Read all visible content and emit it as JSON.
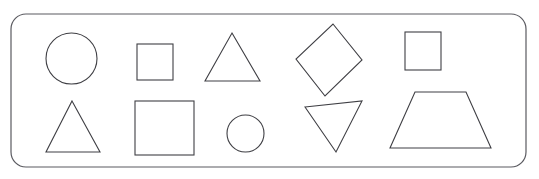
{
  "canvas": {
    "width": 539,
    "height": 179,
    "background_color": "#ffffff",
    "stroke_color": "#3f3f44",
    "fill_color": "none",
    "stroke_width": 1.1,
    "title": "Geometric Shapes Worksheet Panel"
  },
  "frame": {
    "name": "rounded-rectangle-frame",
    "x": 11,
    "y": 14,
    "width": 515,
    "height": 153,
    "corner_radius": 15,
    "stroke_color": "#5a5a60",
    "stroke_width": 1.2
  },
  "rows": [
    {
      "name": "top-row",
      "label": "Top row of shapes",
      "shapes": [
        {
          "id": "shape-circle-large",
          "name": "circle-shape-large",
          "type": "circle",
          "label": "Circle",
          "cx": 71.5,
          "cy": 58.5,
          "r": 25.5,
          "rx": 25.5,
          "ry": 25.5,
          "rotation": 0
        },
        {
          "id": "shape-square-small",
          "name": "square-shape-small",
          "type": "square",
          "label": "Square",
          "x": 137,
          "y": 44,
          "width": 36,
          "height": 36,
          "rotation": 0
        },
        {
          "id": "shape-triangle-up-1",
          "name": "triangle-shape-up-medium",
          "type": "triangle",
          "label": "Triangle",
          "points": "232,33 260,81 205,81",
          "rotation": 0
        },
        {
          "id": "shape-diamond",
          "name": "diamond-shape",
          "type": "diamond",
          "label": "Diamond",
          "points": "333,24 362,60 325,96 296,59",
          "rotation": 0
        },
        {
          "id": "shape-square-top-right",
          "name": "square-shape-top-right",
          "type": "square",
          "label": "Square",
          "x": 405,
          "y": 32,
          "width": 36,
          "height": 38,
          "rotation": 0
        }
      ]
    },
    {
      "name": "bottom-row",
      "label": "Bottom row of shapes",
      "shapes": [
        {
          "id": "shape-triangle-up-2",
          "name": "triangle-shape-up-bottom",
          "type": "triangle",
          "label": "Triangle",
          "points": "72,101 100,152 46,152",
          "rotation": 0
        },
        {
          "id": "shape-square-large",
          "name": "square-shape-large",
          "type": "square",
          "label": "Square",
          "x": 135,
          "y": 101,
          "width": 59,
          "height": 54,
          "rotation": 0
        },
        {
          "id": "shape-circle-small",
          "name": "circle-shape-small",
          "type": "circle",
          "label": "Circle",
          "cx": 245.5,
          "cy": 133.5,
          "r": 18.5,
          "rx": 18.5,
          "ry": 18.5,
          "rotation": 0
        },
        {
          "id": "shape-triangle-down",
          "name": "triangle-shape-inverted",
          "type": "triangle-inverted",
          "label": "Inverted triangle",
          "points": "305,107 362,101 336,152",
          "rotation": 0
        },
        {
          "id": "shape-trapezoid",
          "name": "trapezoid-shape",
          "type": "trapezoid",
          "label": "Trapezoid",
          "points": "415,92 466,92 491,148 390,148",
          "rotation": 0
        }
      ]
    }
  ],
  "summary": {
    "total_shapes": 10,
    "shape_counts": {
      "circle": 2,
      "square": 3,
      "triangle": 2,
      "inverted_triangle": 1,
      "diamond": 1,
      "trapezoid": 1
    }
  }
}
